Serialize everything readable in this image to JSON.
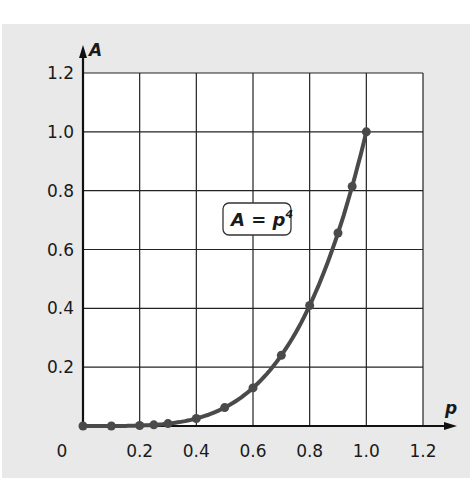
{
  "chart_data": {
    "type": "line",
    "title": "",
    "xlabel": "p",
    "ylabel": "A",
    "xlim": [
      0,
      1.2
    ],
    "ylim": [
      0,
      1.2
    ],
    "grid": true,
    "x_ticks": [
      "0",
      "0.2",
      "0.4",
      "0.6",
      "0.8",
      "1.0",
      "1.2"
    ],
    "y_ticks": [
      "0.2",
      "0.4",
      "0.6",
      "0.8",
      "1.0",
      "1.2"
    ],
    "annotation": {
      "text": "A = p",
      "superscript": "4",
      "x": 0.6,
      "y": 0.7
    },
    "series": [
      {
        "name": "A = p^4",
        "x": [
          0,
          0.1,
          0.2,
          0.25,
          0.3,
          0.4,
          0.5,
          0.6,
          0.7,
          0.8,
          0.9,
          0.95,
          1.0
        ],
        "values": [
          0,
          0.0001,
          0.0016,
          0.0039,
          0.0081,
          0.0256,
          0.0625,
          0.1296,
          0.2401,
          0.4096,
          0.6561,
          0.8145,
          1.0
        ],
        "color": "#4a4a4a"
      }
    ]
  },
  "colors": {
    "panel": "#e9e9e9",
    "curve": "#4a4a4a",
    "grid": "#222222"
  }
}
